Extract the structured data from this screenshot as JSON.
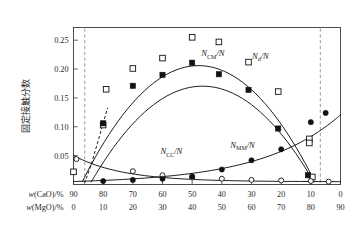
{
  "chart_data": {
    "type": "line",
    "title": "",
    "xlabel_primary": "w(CaO)/%",
    "xlabel_secondary": "w(MgO)/%",
    "ylabel": "固定接触分数",
    "xlim": [
      90,
      0
    ],
    "ylim": [
      0,
      0.272
    ],
    "yticks": [
      0.05,
      0.1,
      0.15,
      0.2,
      0.25
    ],
    "ytick_labels": [
      "0.05",
      "0.10",
      "0.15",
      "0.20",
      "0.25"
    ],
    "xticks_cao": [
      90,
      80,
      70,
      60,
      50,
      40,
      30,
      20,
      10,
      0
    ],
    "xtick_labels_cao": [
      "90",
      "80",
      "70",
      "60",
      "50",
      "40",
      "30",
      "20",
      "10",
      "0"
    ],
    "xticks_mgo": [
      0,
      10,
      20,
      30,
      40,
      50,
      60,
      70,
      80,
      90
    ],
    "xtick_labels_mgo": [
      "0",
      "10",
      "20",
      "30",
      "40",
      "50",
      "60",
      "70",
      "80",
      "90"
    ],
    "grid": false,
    "legend_position": "inline-annotations",
    "annotations": [
      {
        "text": "N_CM/N",
        "base": "N",
        "sub": "CM",
        "tail": "/N",
        "x_cao": 43,
        "y": 0.222
      },
      {
        "text": "N_d/N",
        "base": "N",
        "sub": "d",
        "tail": "/N",
        "x_cao": 27,
        "y": 0.218
      },
      {
        "text": "N_CC/N",
        "base": "N",
        "sub": "CC",
        "tail": "/N",
        "x_cao": 57,
        "y": 0.052
      },
      {
        "text": "N_MM/N",
        "base": "N",
        "sub": "MM",
        "tail": "/N",
        "x_cao": 33,
        "y": 0.063
      }
    ],
    "vertical_dashed_lines": [
      {
        "name": "left-phase-boundary",
        "x_cao": 86.2
      },
      {
        "name": "right-phase-boundary",
        "x_cao": 6.8
      }
    ],
    "series": [
      {
        "name": "N_d/N",
        "marker": "open-square",
        "color": "#111111",
        "x": [
          90,
          80,
          79,
          70,
          60,
          50,
          41,
          31,
          21,
          10.5,
          10.5,
          9.5
        ],
        "values": [
          0.022,
          0.103,
          0.165,
          0.201,
          0.219,
          0.255,
          0.247,
          0.212,
          0.161,
          0.079,
          0.072,
          0.013
        ]
      },
      {
        "name": "N_CM/N",
        "marker": "filled-square",
        "color": "#111111",
        "x": [
          80,
          70,
          60,
          50,
          41,
          31,
          21,
          11
        ],
        "values": [
          0.106,
          0.171,
          0.19,
          0.211,
          0.191,
          0.164,
          0.097,
          0.016
        ]
      },
      {
        "name": "N_CC/N",
        "marker": "open-circle",
        "color": "#111111",
        "x": [
          89,
          70,
          60,
          50,
          40,
          30,
          20,
          10,
          4
        ],
        "values": [
          0.044,
          0.023,
          0.016,
          0.012,
          0.01,
          0.008,
          0.007,
          0.006,
          0.005
        ]
      },
      {
        "name": "N_MM/N",
        "marker": "filled-circle",
        "color": "#111111",
        "x": [
          80,
          70,
          60,
          50,
          40,
          30,
          20,
          10,
          5
        ],
        "values": [
          0.006,
          0.008,
          0.01,
          0.014,
          0.026,
          0.042,
          0.061,
          0.108,
          0.124
        ]
      }
    ]
  }
}
